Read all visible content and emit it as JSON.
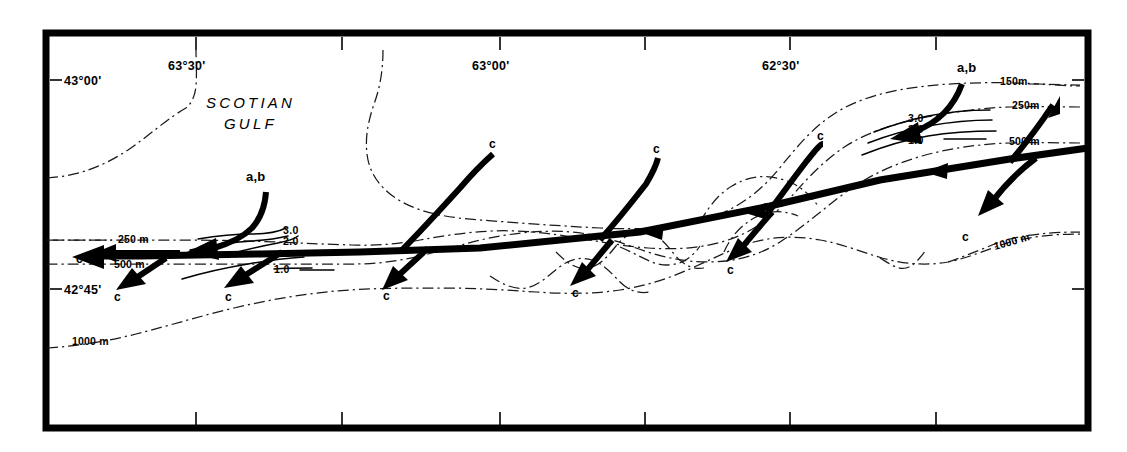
{
  "map": {
    "title_region": "SCOTIAN GULF",
    "longitude_labels": [
      {
        "text": "63°30'",
        "x": 196,
        "y": 70
      },
      {
        "text": "63°00'",
        "x": 500,
        "y": 70
      },
      {
        "text": "62°30'",
        "x": 790,
        "y": 70
      }
    ],
    "latitude_labels": [
      {
        "text": "43°00'",
        "x": 63,
        "y": 84
      },
      {
        "text": "42°45'",
        "x": 63,
        "y": 293
      }
    ],
    "depth_labels": [
      {
        "text": "150m",
        "x": 1000,
        "y": 84
      },
      {
        "text": "250m",
        "x": 1016,
        "y": 106
      },
      {
        "text": "500 m",
        "x": 1012,
        "y": 141
      },
      {
        "text": "250 m",
        "x": 127,
        "y": 240
      },
      {
        "text": "500 m",
        "x": 122,
        "y": 265
      },
      {
        "text": "1000 m",
        "x": 90,
        "y": 342
      },
      {
        "text": "1000 m",
        "x": 1022,
        "y": 253
      }
    ],
    "isotach_labels_right": [
      {
        "text": "3.0",
        "x": 921,
        "y": 118
      },
      {
        "text": "2.0",
        "x": 921,
        "y": 128
      },
      {
        "text": "1.0",
        "x": 921,
        "y": 139
      }
    ],
    "isotach_labels_left": [
      {
        "text": "3.0",
        "x": 285,
        "y": 231
      },
      {
        "text": "2.0",
        "x": 285,
        "y": 242
      },
      {
        "text": "1.0",
        "x": 285,
        "y": 270
      }
    ],
    "station_labels": [
      {
        "text": "c",
        "x": 82,
        "y": 259
      },
      {
        "text": "c",
        "x": 120,
        "y": 297
      },
      {
        "text": "c",
        "x": 231,
        "y": 297
      },
      {
        "text": "c",
        "x": 389,
        "y": 296
      },
      {
        "text": "c",
        "x": 578,
        "y": 293
      },
      {
        "text": "c",
        "x": 733,
        "y": 270
      },
      {
        "text": "c",
        "x": 968,
        "y": 237
      },
      {
        "text": "c",
        "x": 494,
        "y": 145
      },
      {
        "text": "c",
        "x": 658,
        "y": 150
      },
      {
        "text": "c",
        "x": 822,
        "y": 137
      }
    ],
    "ab_labels": [
      {
        "text": "a,b",
        "x": 258,
        "y": 180
      },
      {
        "text": "a,b",
        "x": 971,
        "y": 71
      }
    ],
    "colors": {
      "ink": "#000000",
      "background": "#ffffff",
      "bathymetry": "#1a1a1a"
    },
    "legend_notes": {
      "bathymetry_style": "dash-dot",
      "flow_style": "solid-thick-arrow",
      "isotach_style": "solid-thin"
    }
  }
}
